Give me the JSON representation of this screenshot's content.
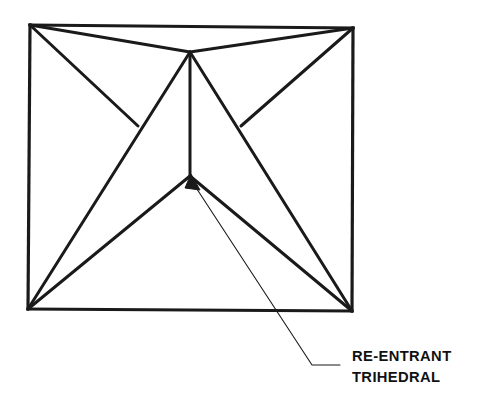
{
  "figure": {
    "background_color": "#ffffff",
    "stroke_color": "#1a1a1a",
    "text_color": "#111111",
    "stroke_width_main": 3.2,
    "stroke_width_leader": 1.1,
    "canvas": {
      "width": 500,
      "height": 415
    }
  },
  "annotation": {
    "label_line1": "RE-ENTRANT",
    "label_line2": "TRIHEDRAL",
    "leader": {
      "arrow_tip": {
        "x": 191,
        "y": 178
      },
      "bend": {
        "x": 312,
        "y": 365
      },
      "end": {
        "x": 340,
        "y": 365
      }
    }
  },
  "geometry": {
    "vertices": {
      "top_left": {
        "x": 30,
        "y": 25
      },
      "top_right": {
        "x": 353,
        "y": 28
      },
      "bottom_left": {
        "x": 28,
        "y": 309
      },
      "bottom_right": {
        "x": 352,
        "y": 311
      },
      "apex": {
        "x": 190,
        "y": 52
      },
      "y_left": {
        "x": 138,
        "y": 126
      },
      "y_right": {
        "x": 241,
        "y": 126
      },
      "reentrant": {
        "x": 190,
        "y": 176
      }
    },
    "edges": [
      {
        "name": "square-top",
        "from": "top_left",
        "to": "top_right"
      },
      {
        "name": "square-right",
        "from": "top_right",
        "to": "bottom_right"
      },
      {
        "name": "square-bottom",
        "from": "bottom_right",
        "to": "bottom_left"
      },
      {
        "name": "square-left",
        "from": "bottom_left",
        "to": "top_left"
      },
      {
        "name": "apex-to-top-left",
        "from": "apex",
        "to": "top_left"
      },
      {
        "name": "apex-to-top-right",
        "from": "apex",
        "to": "top_right"
      },
      {
        "name": "apex-vertical",
        "from": "apex",
        "to": "reentrant"
      },
      {
        "name": "top-left-to-y-left",
        "from": "top_left",
        "to": "y_left"
      },
      {
        "name": "top-right-to-y-right",
        "from": "top_right",
        "to": "y_right"
      },
      {
        "name": "apex-to-bottom-left",
        "from": "apex",
        "to": "bottom_left"
      },
      {
        "name": "apex-to-bottom-right",
        "from": "apex",
        "to": "bottom_right"
      },
      {
        "name": "reentrant-to-bl",
        "from": "reentrant",
        "to": "bottom_left"
      },
      {
        "name": "reentrant-to-br",
        "from": "reentrant",
        "to": "bottom_right"
      }
    ]
  }
}
